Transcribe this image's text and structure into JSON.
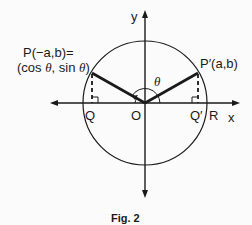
{
  "figure": {
    "caption": "Fig. 2",
    "axes": {
      "x_label": "x",
      "y_label": "y"
    },
    "points": {
      "P_line1": "P(−a,b)=",
      "P_line2_a": "(cos ",
      "P_line2_theta1": "θ",
      "P_line2_b": ", sin ",
      "P_line2_theta2": "θ",
      "P_line2_c": ")",
      "P_prime": "P′(a,b)",
      "Q": "Q",
      "O": "O",
      "Q_prime": "Q′",
      "R": "R"
    },
    "angle_label": "θ"
  }
}
